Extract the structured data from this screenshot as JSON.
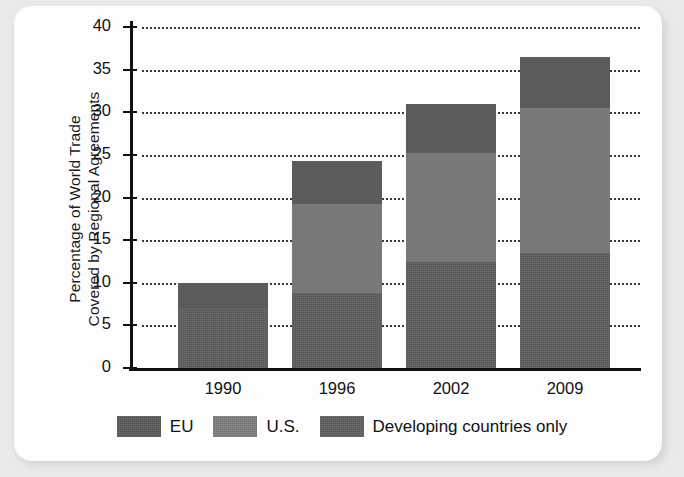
{
  "chart_data": {
    "type": "bar",
    "subtype": "stacked-bar",
    "title": "",
    "xlabel": "",
    "ylabel": "Percentage of World Trade Covered by Regional Agreements",
    "ylabel_lines": [
      "Percentage of World Trade",
      "Covered by Regional Agreements"
    ],
    "categories": [
      "1990",
      "1996",
      "2002",
      "2009"
    ],
    "ylim": [
      0,
      40
    ],
    "yticks": [
      0,
      5,
      10,
      15,
      20,
      25,
      30,
      35,
      40
    ],
    "ytick_labels": [
      "0",
      "5",
      "10",
      "15",
      "20",
      "25",
      "30",
      "35",
      "40"
    ],
    "grid": "horizontal-dotted",
    "legend_position": "bottom-center",
    "stack_order_bottom_to_top": [
      "Developing countries only",
      "U.S.",
      "EU"
    ],
    "series": [
      {
        "name": "Developing countries only",
        "color": "#5e5e5e",
        "values": [
          7.0,
          8.8,
          12.4,
          13.5
        ]
      },
      {
        "name": "U.S.",
        "color": "#787878",
        "values": [
          0.0,
          10.4,
          12.8,
          17.0
        ]
      },
      {
        "name": "EU",
        "color": "#5a5a5a",
        "values": [
          3.0,
          5.1,
          5.8,
          6.0
        ]
      }
    ],
    "cumulative_tops": {
      "Developing countries only": [
        7.0,
        8.8,
        12.4,
        13.5
      ],
      "U.S.": [
        7.0,
        19.2,
        25.2,
        30.5
      ],
      "EU": [
        10.0,
        24.3,
        31.0,
        36.5
      ]
    },
    "totals": [
      10.0,
      24.3,
      31.0,
      36.5
    ]
  },
  "legend": {
    "items": [
      {
        "label": "EU",
        "swatch": "eu"
      },
      {
        "label": "U.S.",
        "swatch": "us"
      },
      {
        "label": "Developing countries only",
        "swatch": "dev"
      }
    ]
  },
  "colors": {
    "background": "#e9e9e7",
    "card": "#fdfdfd",
    "axis": "#111111",
    "eu": "#5a5a5a",
    "us": "#787878",
    "dev": "#5e5e5e"
  }
}
